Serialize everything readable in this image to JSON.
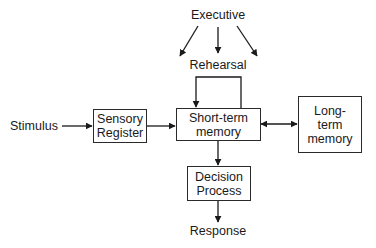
{
  "diagram": {
    "type": "information-processing-model",
    "colors": {
      "stroke": "#1a1a1a",
      "background": "#ffffff"
    },
    "labels": {
      "executive": "Executive",
      "rehearsal": "Rehearsal",
      "stimulus": "Stimulus",
      "response": "Response"
    },
    "boxes": {
      "sensory_register": {
        "line1": "Sensory",
        "line2": "Register"
      },
      "short_term_memory": {
        "line1": "Short-term",
        "line2": "memory"
      },
      "long_term_memory": {
        "line1": "Long-",
        "line2": "term",
        "line3": "memory"
      },
      "decision_process": {
        "line1": "Decision",
        "line2": "Process"
      }
    },
    "edges": [
      {
        "from": "Stimulus",
        "to": "Sensory Register",
        "type": "one-way"
      },
      {
        "from": "Sensory Register",
        "to": "Short-term memory",
        "type": "one-way"
      },
      {
        "from": "Short-term memory",
        "to": "Long-term memory",
        "type": "two-way"
      },
      {
        "from": "Short-term memory",
        "to": "Short-term memory",
        "type": "loop",
        "label": "Rehearsal"
      },
      {
        "from": "Short-term memory",
        "to": "Decision Process",
        "type": "one-way"
      },
      {
        "from": "Decision Process",
        "to": "Response",
        "type": "one-way"
      },
      {
        "from": "Executive",
        "to": "Sensory Register",
        "type": "one-way"
      },
      {
        "from": "Executive",
        "to": "Rehearsal",
        "type": "one-way"
      },
      {
        "from": "Executive",
        "to": "Long-term memory",
        "type": "one-way"
      }
    ]
  }
}
